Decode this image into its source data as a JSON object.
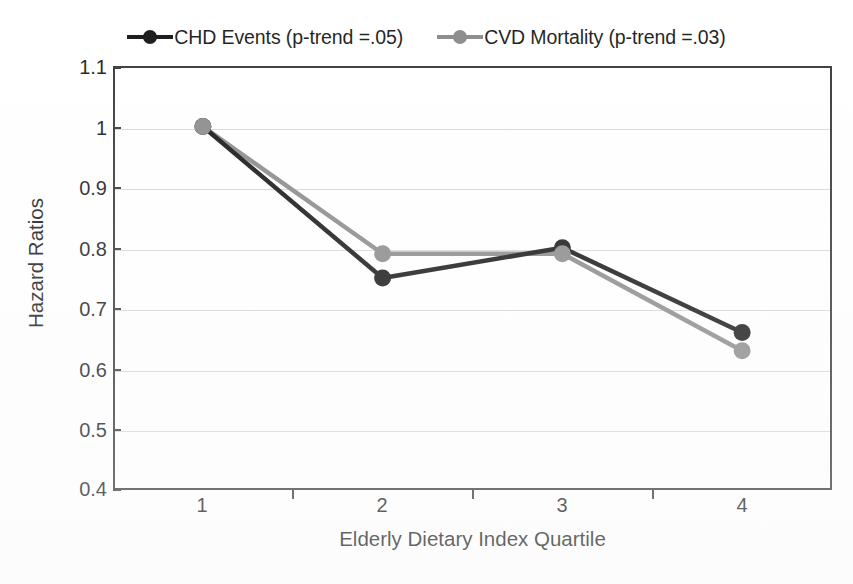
{
  "chart_data": {
    "type": "line",
    "title": "",
    "xlabel": "Elderly Dietary Index Quartile",
    "ylabel": "Hazard Ratios",
    "categories": [
      "1",
      "2",
      "3",
      "4"
    ],
    "x": [
      1,
      2,
      3,
      4
    ],
    "ylim": [
      0.4,
      1.1
    ],
    "yticks": [
      "0.4",
      "0.5",
      "0.6",
      "0.7",
      "0.8",
      "0.9",
      "1",
      "1.1"
    ],
    "ytick_values": [
      0.4,
      0.5,
      0.6,
      0.7,
      0.8,
      0.9,
      1.0,
      1.1
    ],
    "grid": "horizontal",
    "legend_position": "top-center",
    "series": [
      {
        "name": "CHD Events (p-trend =.05)",
        "values": [
          1.0,
          0.75,
          0.8,
          0.66
        ],
        "color": "#1a1a1a",
        "marker": "circle"
      },
      {
        "name": "CVD Mortality (p-trend =.03)",
        "values": [
          1.0,
          0.79,
          0.79,
          0.63
        ],
        "color": "#8c8c8c",
        "marker": "circle"
      }
    ]
  },
  "legend": {
    "entries": [
      {
        "label": "CHD Events (p-trend =.05)",
        "color": "#1a1a1a"
      },
      {
        "label": "CVD Mortality (p-trend =.03)",
        "color": "#8c8c8c"
      }
    ]
  },
  "axes": {
    "y_title": "Hazard Ratios",
    "x_title": "Elderly Dietary Index Quartile",
    "y_ticks": [
      "1.1",
      "1",
      "0.9",
      "0.8",
      "0.7",
      "0.6",
      "0.5",
      "0.4"
    ],
    "x_ticks": [
      "1",
      "2",
      "3",
      "4"
    ]
  },
  "colors": {
    "chd_series": "#1a1a1a",
    "cvd_series": "#8c8c8c",
    "axis": "#3b3b3b",
    "gridline": "#d8d8d8",
    "background": "#ffffff"
  }
}
